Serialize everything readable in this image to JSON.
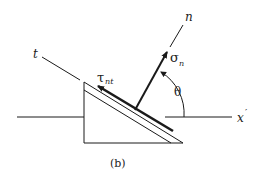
{
  "figure": {
    "caption": "(b)",
    "labels": {
      "normal_axis": "n",
      "tangent_axis": "t",
      "reference_axis": "x",
      "reference_axis_prime": "′",
      "angle": "θ",
      "normal_stress_symbol": "σ",
      "normal_stress_subscript": "n",
      "shear_stress_symbol": "τ",
      "shear_stress_subscript": "nt"
    },
    "colors": {
      "stroke": "#1a1a1a",
      "background": "#ffffff"
    }
  }
}
